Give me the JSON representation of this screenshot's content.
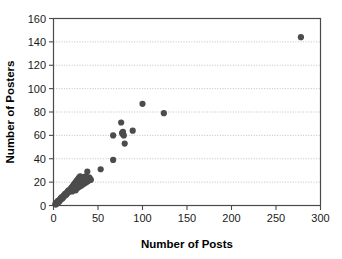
{
  "chart_data": {
    "type": "scatter",
    "title": "",
    "xlabel": "Number of Posts",
    "ylabel": "Number of Posters",
    "xlim": [
      0,
      300
    ],
    "ylim": [
      0,
      160
    ],
    "xticks": [
      0,
      50,
      100,
      150,
      200,
      250,
      300
    ],
    "yticks": [
      0,
      20,
      40,
      60,
      80,
      100,
      120,
      140,
      160
    ],
    "xtick_labels": [
      "0",
      "50",
      "100",
      "150",
      "200",
      "250",
      "300"
    ],
    "ytick_labels": [
      "0",
      "20",
      "40",
      "60",
      "80",
      "100",
      "120",
      "140",
      "160"
    ],
    "grid": "horizontal-dotted",
    "legend": "none",
    "marker_color": "#4c4c4c",
    "marker_size": 5.2,
    "background_color": "#ffffff",
    "axis_color": "#4a4a4a",
    "gridline_color": "#b9b9b9",
    "series": [
      {
        "name": "Posters vs Posts",
        "points": [
          [
            2,
            1
          ],
          [
            3,
            2
          ],
          [
            3,
            1
          ],
          [
            4,
            3
          ],
          [
            4,
            2
          ],
          [
            5,
            3
          ],
          [
            5,
            4
          ],
          [
            6,
            4
          ],
          [
            6,
            3
          ],
          [
            7,
            5
          ],
          [
            7,
            4
          ],
          [
            8,
            6
          ],
          [
            8,
            5
          ],
          [
            9,
            6
          ],
          [
            9,
            7
          ],
          [
            10,
            7
          ],
          [
            10,
            6
          ],
          [
            11,
            8
          ],
          [
            11,
            7
          ],
          [
            12,
            9
          ],
          [
            12,
            8
          ],
          [
            13,
            9
          ],
          [
            13,
            10
          ],
          [
            14,
            10
          ],
          [
            14,
            9
          ],
          [
            15,
            11
          ],
          [
            15,
            10
          ],
          [
            16,
            12
          ],
          [
            16,
            11
          ],
          [
            17,
            12
          ],
          [
            17,
            13
          ],
          [
            18,
            13
          ],
          [
            18,
            12
          ],
          [
            19,
            14
          ],
          [
            19,
            13
          ],
          [
            20,
            15
          ],
          [
            20,
            14
          ],
          [
            21,
            16
          ],
          [
            21,
            12
          ],
          [
            22,
            17
          ],
          [
            22,
            15
          ],
          [
            23,
            18
          ],
          [
            23,
            14
          ],
          [
            24,
            19
          ],
          [
            24,
            16
          ],
          [
            25,
            20
          ],
          [
            25,
            13
          ],
          [
            26,
            21
          ],
          [
            26,
            17
          ],
          [
            27,
            22
          ],
          [
            27,
            15
          ],
          [
            28,
            23
          ],
          [
            28,
            18
          ],
          [
            29,
            24
          ],
          [
            29,
            16
          ],
          [
            30,
            25
          ],
          [
            30,
            19
          ],
          [
            31,
            22
          ],
          [
            31,
            17
          ],
          [
            32,
            23
          ],
          [
            32,
            20
          ],
          [
            33,
            18
          ],
          [
            34,
            24
          ],
          [
            34,
            21
          ],
          [
            35,
            19
          ],
          [
            36,
            25
          ],
          [
            36,
            22
          ],
          [
            37,
            20
          ],
          [
            38,
            29
          ],
          [
            38,
            23
          ],
          [
            39,
            21
          ],
          [
            40,
            24
          ],
          [
            41,
            23
          ],
          [
            42,
            22
          ],
          [
            53,
            31
          ],
          [
            67,
            39
          ],
          [
            67,
            60
          ],
          [
            76,
            71
          ],
          [
            77,
            62
          ],
          [
            78,
            63
          ],
          [
            78,
            61
          ],
          [
            79,
            60
          ],
          [
            80,
            53
          ],
          [
            89,
            64
          ],
          [
            100,
            87
          ],
          [
            124,
            79
          ],
          [
            278,
            144
          ]
        ]
      }
    ]
  }
}
